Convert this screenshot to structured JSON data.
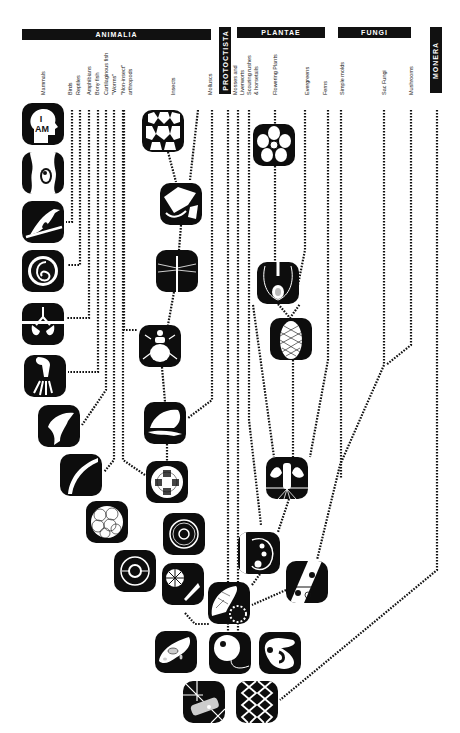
{
  "kingdoms": {
    "animalia": "ANIMALIA",
    "protoctista": "PROTOCTISTA",
    "plantae": "PLANTAE",
    "fungi": "FUNGI",
    "monera": "MONERA"
  },
  "groups": {
    "mammals": "Mammals",
    "birds": "Birds",
    "reptiles": "Reptiles",
    "amphibians": "Amphibians",
    "bony_fish": "Bony fish",
    "cartilaginous_fish": "Cartilaginous fish",
    "worms": "\"Worms\"",
    "non_insect_1": "\"Non-insect\"",
    "non_insect_2": "arthropods",
    "insects": "Insects",
    "molluscs": "Molluscs",
    "mosses_1": "Mosses and",
    "mosses_2": "Liverworts",
    "scouring_1": "Scouring rushes",
    "scouring_2": "& horsetails",
    "flowering": "Flowering Plants",
    "evergreens": "Evergreens",
    "ferns": "Ferns",
    "simple_molds": "Simple molds",
    "sac_fungi": "Sac Fungi",
    "mushrooms": "Mushrooms"
  },
  "tiles": [
    {
      "id": "human-i-am",
      "label": "I AM",
      "x": 22,
      "y": 103
    },
    {
      "id": "fetus",
      "x": 22,
      "y": 152
    },
    {
      "id": "bird",
      "x": 22,
      "y": 201
    },
    {
      "id": "egg-embryo",
      "x": 22,
      "y": 250
    },
    {
      "id": "lungs",
      "x": 22,
      "y": 303
    },
    {
      "id": "limb-bones",
      "x": 24,
      "y": 355
    },
    {
      "id": "fish",
      "x": 38,
      "y": 405
    },
    {
      "id": "eel-shark",
      "x": 60,
      "y": 454
    },
    {
      "id": "blastula",
      "x": 86,
      "y": 501
    },
    {
      "id": "ring-cell",
      "x": 114,
      "y": 550
    },
    {
      "id": "honeycomb-eye",
      "x": 142,
      "y": 110
    },
    {
      "id": "wing",
      "x": 160,
      "y": 183
    },
    {
      "id": "dragonfly",
      "x": 156,
      "y": 250
    },
    {
      "id": "beetle",
      "x": 139,
      "y": 325
    },
    {
      "id": "shell",
      "x": 144,
      "y": 402
    },
    {
      "id": "cleavage",
      "x": 146,
      "y": 461
    },
    {
      "id": "target-cell",
      "x": 163,
      "y": 513
    },
    {
      "id": "radial-cell",
      "x": 162,
      "y": 563
    },
    {
      "id": "colony",
      "x": 155,
      "y": 631
    },
    {
      "id": "flower",
      "x": 253,
      "y": 124
    },
    {
      "id": "ovule",
      "x": 257,
      "y": 262
    },
    {
      "id": "cone",
      "x": 270,
      "y": 318
    },
    {
      "id": "tree-roots",
      "x": 266,
      "y": 457
    },
    {
      "id": "moss-cell",
      "x": 238,
      "y": 532
    },
    {
      "id": "plant-cell",
      "x": 208,
      "y": 582
    },
    {
      "id": "fungal-hypha",
      "x": 286,
      "y": 561
    },
    {
      "id": "sperm-cell",
      "x": 209,
      "y": 632
    },
    {
      "id": "amoeba",
      "x": 259,
      "y": 632
    },
    {
      "id": "crystal",
      "x": 183,
      "y": 681
    },
    {
      "id": "dna",
      "x": 236,
      "y": 681
    }
  ]
}
